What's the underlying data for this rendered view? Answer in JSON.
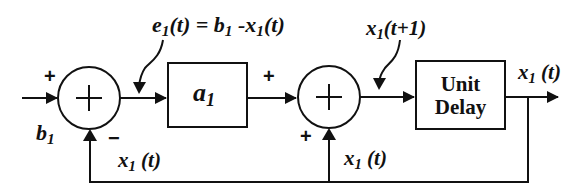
{
  "diagram": {
    "type": "block-diagram",
    "colors": {
      "stroke": "#111111",
      "background": "#ffffff"
    },
    "nodes": [
      {
        "id": "sum1",
        "kind": "summing-junction",
        "symbol": "+"
      },
      {
        "id": "gain",
        "kind": "block",
        "label_main": "a",
        "label_sub": "1"
      },
      {
        "id": "sum2",
        "kind": "summing-junction",
        "symbol": "+"
      },
      {
        "id": "delay",
        "kind": "block",
        "label_line1": "Unit",
        "label_line2": "Delay"
      }
    ],
    "labels": {
      "input": {
        "main": "b",
        "sub": "1"
      },
      "error": {
        "e": "e",
        "e_sub": "1",
        "mid": "(t) = b",
        "b_sub": "1",
        "rest": " -x",
        "x_sub": "1",
        "end": "(t)"
      },
      "next_state": {
        "main": "x",
        "sub": "1",
        "end": "(t+1)"
      },
      "output": {
        "main": "x",
        "sub": "1",
        "end": " (t)"
      },
      "feedback1": {
        "main": "x",
        "sub": "1",
        "end": " (t)"
      },
      "feedback2": {
        "main": "x",
        "sub": "1",
        "end": " (t)"
      }
    },
    "signs": {
      "sum1_input": "+",
      "sum1_feedback": "−",
      "sum2_input": "+",
      "sum2_feedback": "+"
    }
  }
}
